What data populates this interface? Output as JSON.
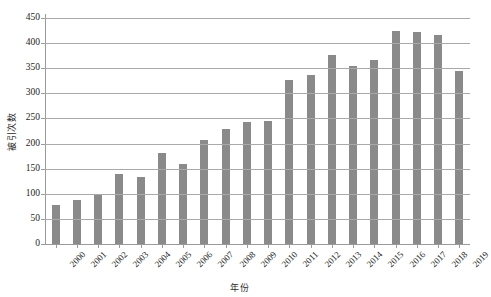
{
  "chart_data": {
    "type": "bar",
    "title": "",
    "xlabel": "年份",
    "ylabel": "被引次数",
    "categories": [
      "2000",
      "2001",
      "2002",
      "2003",
      "2004",
      "2005",
      "2006",
      "2007",
      "2008",
      "2009",
      "2010",
      "2011",
      "2012",
      "2013",
      "2014",
      "2015",
      "2016",
      "2017",
      "2018",
      "2019"
    ],
    "values": [
      77,
      88,
      99,
      139,
      133,
      182,
      160,
      207,
      229,
      242,
      245,
      326,
      337,
      377,
      354,
      366,
      424,
      423,
      417,
      345
    ],
    "ylim": [
      0,
      450
    ],
    "ytick_interval": 50,
    "yticks": [
      0,
      50,
      100,
      150,
      200,
      250,
      300,
      350,
      400,
      450
    ],
    "grid": true,
    "legend": "none",
    "series": [
      {
        "name": "被引次数",
        "values": [
          77,
          88,
          99,
          139,
          133,
          182,
          160,
          207,
          229,
          242,
          245,
          326,
          337,
          377,
          354,
          366,
          424,
          423,
          417,
          345
        ]
      }
    ],
    "bar_color": "#8a8a8a",
    "gridline_color": "#a9a9a9",
    "axis_color": "#9a9a9a",
    "text_color": "#1d1d1d",
    "background_color": "#ffffff"
  }
}
